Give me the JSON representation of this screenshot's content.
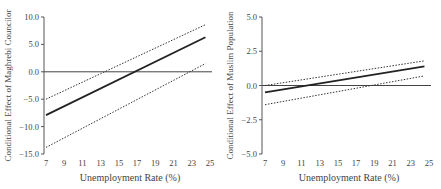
{
  "chart_data": [
    {
      "type": "line",
      "title": "",
      "xlabel": "Unemployment Rate (%)",
      "ylabel": "Conditional Effect of Maghrebi Councilor",
      "xlim": [
        7,
        25
      ],
      "ylim": [
        -15,
        10
      ],
      "xticks": [
        7,
        9,
        11,
        13,
        15,
        17,
        19,
        21,
        23,
        25
      ],
      "yticks": [
        10.0,
        5.0,
        0.0,
        -5.0,
        -10.0,
        -15.0
      ],
      "ytick_labels": [
        "10.0",
        "5.0",
        "0.0",
        "-5.0",
        "-10.0",
        "-15.0"
      ],
      "grid": false,
      "reference_line_y": 0,
      "series": [
        {
          "name": "Conditional effect",
          "style": "solid",
          "x": [
            7.0,
            24.5
          ],
          "y": [
            -7.9,
            6.3
          ]
        },
        {
          "name": "Upper 95% CI",
          "style": "dotted",
          "x": [
            7.0,
            24.5
          ],
          "y": [
            -5.0,
            8.6
          ]
        },
        {
          "name": "Lower 95% CI",
          "style": "dotted",
          "x": [
            7.0,
            24.5
          ],
          "y": [
            -13.8,
            1.5
          ]
        }
      ]
    },
    {
      "type": "line",
      "title": "",
      "xlabel": "Unemployment Rate (%)",
      "ylabel": "Conditional Effect of Muslim Population",
      "xlim": [
        7,
        25
      ],
      "ylim": [
        -5,
        5
      ],
      "xticks": [
        7,
        9,
        11,
        13,
        15,
        17,
        19,
        21,
        23,
        25
      ],
      "yticks": [
        5.0,
        2.5,
        0.0,
        -2.5,
        -5.0
      ],
      "ytick_labels": [
        "5.0",
        "2.5",
        "0.0",
        "-2.5",
        "-5.0"
      ],
      "grid": false,
      "reference_line_y": 0,
      "series": [
        {
          "name": "Conditional effect",
          "style": "solid",
          "x": [
            7.0,
            24.5
          ],
          "y": [
            -0.5,
            1.4
          ]
        },
        {
          "name": "Upper 95% CI",
          "style": "dotted",
          "x": [
            7.0,
            24.5
          ],
          "y": [
            0.0,
            1.8
          ]
        },
        {
          "name": "Lower 95% CI",
          "style": "dotted",
          "x": [
            7.0,
            24.5
          ],
          "y": [
            -1.4,
            0.7
          ]
        }
      ]
    }
  ]
}
